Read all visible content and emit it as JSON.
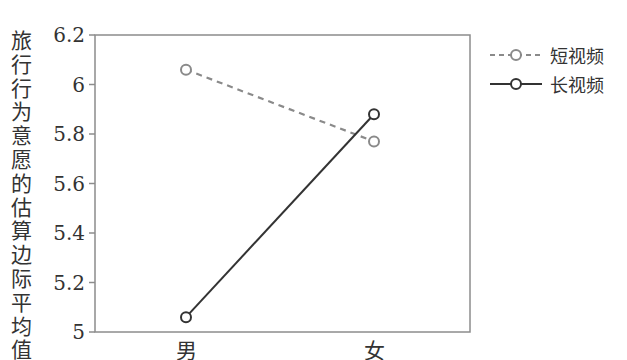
{
  "chart_data": {
    "type": "line",
    "title": "",
    "xlabel": "",
    "ylabel": "旅行行为意愿的估算边际平均值",
    "categories": [
      "男",
      "女"
    ],
    "series": [
      {
        "name": "短视频",
        "values": [
          6.06,
          5.77
        ],
        "style": "dashed",
        "color": "#8a8a8a"
      },
      {
        "name": "长视频",
        "values": [
          5.06,
          5.88
        ],
        "style": "solid",
        "color": "#333333"
      }
    ],
    "ylim": [
      5,
      6.2
    ],
    "yticks": [
      "5",
      "5.2",
      "5.4",
      "5.6",
      "5.8",
      "6",
      "6.2"
    ],
    "grid": false,
    "legend_position": "right"
  },
  "legend": {
    "items": [
      {
        "label": "短视频"
      },
      {
        "label": "长视频"
      }
    ]
  }
}
